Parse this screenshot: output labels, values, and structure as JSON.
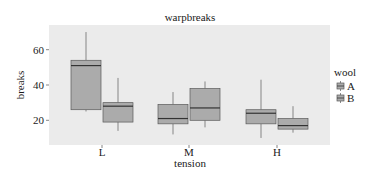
{
  "chart_data": {
    "type": "boxplot",
    "title": "warpbreaks",
    "xlabel": "tension",
    "ylabel": "breaks",
    "categories": [
      "L",
      "M",
      "H"
    ],
    "yticks": [
      20,
      40,
      60
    ],
    "ylim": [
      5,
      74
    ],
    "grid": false,
    "legend": {
      "title": "wool",
      "position": "right",
      "entries": [
        "A",
        "B"
      ]
    },
    "series": [
      {
        "name": "A",
        "boxes": [
          {
            "category": "L",
            "min": 25,
            "q1": 26,
            "median": 51,
            "q3": 54,
            "max": 70
          },
          {
            "category": "M",
            "min": 12,
            "q1": 18,
            "median": 21,
            "q3": 29,
            "max": 36
          },
          {
            "category": "H",
            "min": 10,
            "q1": 18,
            "median": 24,
            "q3": 26,
            "max": 43
          }
        ]
      },
      {
        "name": "B",
        "boxes": [
          {
            "category": "L",
            "min": 14,
            "q1": 19,
            "median": 28,
            "q3": 30,
            "max": 44
          },
          {
            "category": "M",
            "min": 16,
            "q1": 20,
            "median": 27,
            "q3": 38,
            "max": 42
          },
          {
            "category": "H",
            "min": 13,
            "q1": 15,
            "median": 17,
            "q3": 21,
            "max": 28
          }
        ]
      }
    ],
    "colors": {
      "panel_bg": "#ebebeb",
      "box_fill": "#ababab",
      "box_stroke": "#5a5a5a",
      "median": "#333333"
    }
  }
}
